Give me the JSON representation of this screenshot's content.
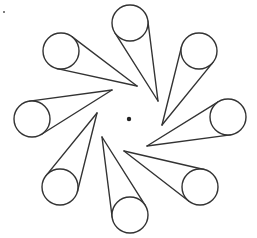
{
  "diagram": {
    "type": "pinwheel-cones",
    "width": 257,
    "height": 238,
    "stroke_color": "#333333",
    "stroke_width": 1.4,
    "background": "#ffffff",
    "center_dot": {
      "x": 129,
      "y": 119,
      "r": 2.2,
      "color": "#222222"
    },
    "corner_mark": {
      "x": 4,
      "y": 12,
      "r": 1,
      "color": "#555555"
    },
    "circle_radius": 18,
    "cones": [
      {
        "name": "top",
        "circle": [
          130,
          23
        ],
        "tip": [
          158,
          101
        ]
      },
      {
        "name": "top-right",
        "circle": [
          199,
          51
        ],
        "tip": [
          162,
          125
        ]
      },
      {
        "name": "right",
        "circle": [
          228,
          117
        ],
        "tip": [
          147,
          146
        ]
      },
      {
        "name": "bottom-right",
        "circle": [
          200,
          187
        ],
        "tip": [
          124,
          151
        ]
      },
      {
        "name": "bottom",
        "circle": [
          130,
          215
        ],
        "tip": [
          102,
          137
        ]
      },
      {
        "name": "bottom-left",
        "circle": [
          60,
          187
        ],
        "tip": [
          97,
          113
        ]
      },
      {
        "name": "left",
        "circle": [
          32,
          119
        ],
        "tip": [
          112,
          90
        ]
      },
      {
        "name": "top-left",
        "circle": [
          61,
          51
        ],
        "tip": [
          137,
          86
        ]
      }
    ]
  }
}
